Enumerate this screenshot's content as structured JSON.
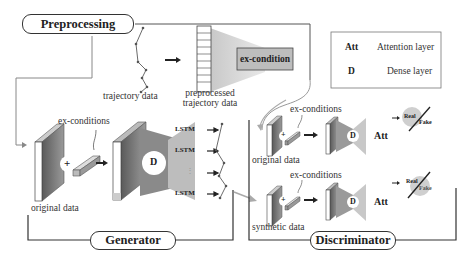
{
  "sections": {
    "preprocessing": {
      "title": "Preprocessing"
    },
    "generator": {
      "title": "Generator"
    },
    "discriminator": {
      "title": "Discriminator"
    }
  },
  "preprocessing": {
    "trajectory_label": "trajectory data",
    "preprocessed_label_line1": "preprocessed",
    "preprocessed_label_line2": "trajectory data",
    "ex_condition_box": "ex-condition"
  },
  "legend": {
    "items": [
      {
        "symbol": "Att",
        "description": "Attention layer"
      },
      {
        "symbol": "D",
        "description": "Dense layer"
      }
    ]
  },
  "generator": {
    "ex_conditions_label": "ex-conditions",
    "original_data_label": "original data",
    "plus_symbol": "+",
    "dense_symbol": "D",
    "lstm_labels": [
      "LSTM",
      "LSTM",
      "⋮",
      "LSTM"
    ]
  },
  "discriminator": {
    "top": {
      "ex_conditions_label": "ex-conditions",
      "input_label": "original data",
      "plus_symbol": "+",
      "dense_symbol": "D",
      "attention_symbol": "Att",
      "output_real": "Real",
      "output_fake": "Fake",
      "highlighted": "Real"
    },
    "bottom": {
      "ex_conditions_label": "ex-conditions",
      "input_label": "synthetic data",
      "plus_symbol": "+",
      "dense_symbol": "D",
      "attention_symbol": "Att",
      "output_real": "Real",
      "output_fake": "Fake",
      "highlighted": "Fake"
    }
  },
  "colors": {
    "line": "#333333",
    "gray_light": "#d0d0d0",
    "gray_mid": "#9a9a9a",
    "gray_dark": "#666666",
    "highlight_circle": "#cfcfcf"
  }
}
